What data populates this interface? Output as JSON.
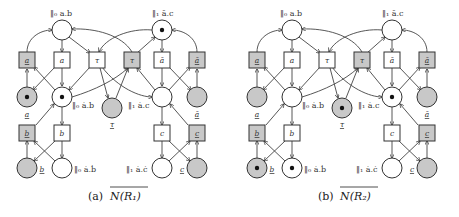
{
  "figures": [
    {
      "id": "a",
      "caption_prefix": "(a)",
      "caption_math": "N(R₁)",
      "top_left_label": "‖₀ a.b",
      "top_right_label": "‖₁ ā.c",
      "mid_left_label": "‖₀ ȧ.b",
      "mid_right_label": "‖₁ ȧ.c",
      "bot_left_label": "‖₀ ȧ.ḃ",
      "bot_right_label": "‖₁ ȧ.ċ",
      "tokens": {
        "top_left": false,
        "top_right": true,
        "mid_left_gray": true,
        "mid_left": true,
        "tau_place": false,
        "mid_right": false,
        "mid_right_gray": false,
        "bot_left_gray": false,
        "bot_left": false,
        "bot_right": false,
        "bot_right_gray": false
      },
      "transitions": [
        "a",
        "a",
        "τ",
        "τ",
        "ā",
        "ā",
        "b",
        "b",
        "c",
        "c"
      ],
      "place_labels": [
        "a",
        "τ",
        "ā",
        "b",
        "c"
      ]
    },
    {
      "id": "b",
      "caption_prefix": "(b)",
      "caption_math": "N(R₂)",
      "top_left_label": "‖₀ a.b",
      "top_right_label": "‖₁ ā.c",
      "mid_left_label": "‖₀ ȧ.b",
      "mid_right_label": "‖₁ ȧ.c",
      "bot_left_label": "‖₀ ȧ.ḃ",
      "bot_right_label": "‖₁ ȧ.ċ",
      "tokens": {
        "top_left": false,
        "top_right": false,
        "mid_left_gray": false,
        "mid_left": false,
        "tau_place": true,
        "mid_right": true,
        "mid_right_gray": false,
        "bot_left_gray": true,
        "bot_left": true,
        "bot_right": false,
        "bot_right_gray": false
      },
      "transitions": [
        "a",
        "a",
        "τ",
        "τ",
        "ā",
        "ā",
        "b",
        "b",
        "c",
        "c"
      ],
      "place_labels": [
        "a",
        "τ",
        "ā",
        "b",
        "c"
      ]
    }
  ],
  "colors": {
    "gray_fill": "#c8c8c8",
    "stroke": "#333333",
    "white": "#ffffff"
  }
}
